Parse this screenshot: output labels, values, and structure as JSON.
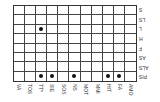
{
  "matrix": {
    "columns": [
      "VA",
      "TOS",
      "TT*",
      "SIE",
      "SOS",
      "NS",
      "MOT",
      "MMI",
      "HIT",
      "FA",
      "AMO"
    ],
    "rows": [
      "S",
      "LS",
      "L",
      "H",
      "F",
      "AS",
      "ALS",
      "PIS"
    ],
    "marks": [
      {
        "row": "L",
        "col": "TT*"
      },
      {
        "row": "PIS",
        "col": "TT*"
      },
      {
        "row": "PIS",
        "col": "SIE"
      },
      {
        "row": "PIS",
        "col": "NS"
      },
      {
        "row": "PIS",
        "col": "HIT"
      },
      {
        "row": "PIS",
        "col": "FA"
      }
    ],
    "line_color": "#444444",
    "dot_color": "#111111"
  }
}
